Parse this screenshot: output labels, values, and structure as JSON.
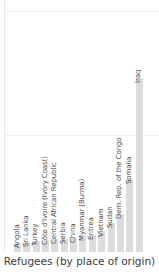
{
  "chart_data": {
    "type": "bar",
    "title": "",
    "subtitle": "",
    "xlabel": "Refugees (by place of origin)",
    "ylabel": "",
    "grid": true,
    "legend": null,
    "orientation": "vertical",
    "bar_color": "#dcdcdc",
    "gridline_color": "#f0f0f0",
    "label_rotation": -90,
    "ylim": [
      0,
      1.0
    ],
    "categories": [
      "Angola",
      "Sri Lanka",
      "Turkey",
      "Côte d'Ivoire (Ivory Coast)",
      "Central African Republic",
      "Serbia",
      "China",
      "Myanmar (Burma)",
      "Eritrea",
      "Vietnam",
      "Sudan",
      "Dem. Rep. of the Congo",
      "Somalia",
      "Iraq"
    ],
    "values": [
      0.035,
      0.04,
      0.043,
      0.046,
      0.05,
      0.052,
      0.056,
      0.062,
      0.068,
      0.08,
      0.115,
      0.15,
      0.29,
      0.69
    ],
    "gridlines_y": [
      0.465,
      0.955
    ]
  },
  "axis": {
    "x_title": "Refugees (by place of origin)"
  },
  "colors": {
    "bar": "#dcdcdc",
    "grid": "#f0f0f0",
    "spine": "#e8e8e8",
    "label_text": "#4a4a4a",
    "title_text": "#3c3c3c",
    "background": "#ffffff"
  }
}
